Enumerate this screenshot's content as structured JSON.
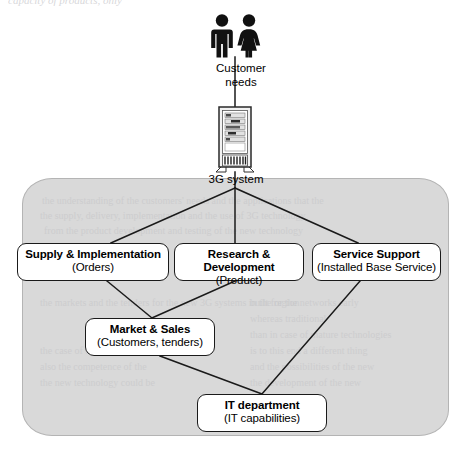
{
  "page": {
    "width": 469,
    "height": 454,
    "background": "#ffffff",
    "top_partial_caption": "capacity of products, only"
  },
  "diagram": {
    "type": "organizational-flow",
    "panel": {
      "name": "organisation-boundary",
      "fill": "#d9d9d9",
      "stroke": "#b4b4b4"
    },
    "actor": {
      "icon": "two-people-icon",
      "label_line1": "Customer",
      "label_line2": "needs",
      "color": "#000000"
    },
    "system": {
      "icon": "server-tower-icon",
      "label": "3G system",
      "color": "#000000"
    },
    "nodes": [
      {
        "id": "supply",
        "title": "Supply & Implementation",
        "subtitle": "(Orders)"
      },
      {
        "id": "rnd",
        "title": "Research & Development",
        "subtitle": "(Product)"
      },
      {
        "id": "service",
        "title": "Service Support",
        "subtitle": "(Installed Base Service)"
      },
      {
        "id": "market",
        "title": "Market & Sales",
        "subtitle": "(Customers, tenders)"
      },
      {
        "id": "it",
        "title": "IT department",
        "subtitle": "(IT capabilities)"
      }
    ],
    "connections": [
      {
        "from": "customer",
        "to": "system"
      },
      {
        "from": "system",
        "to": "supply"
      },
      {
        "from": "system",
        "to": "rnd"
      },
      {
        "from": "system",
        "to": "service"
      },
      {
        "from": "supply",
        "to": "market"
      },
      {
        "from": "rnd",
        "to": "market"
      },
      {
        "from": "market",
        "to": "it"
      },
      {
        "from": "service",
        "to": "it"
      }
    ]
  },
  "bleed_text": [
    "the understanding of the customers' needs and the applications that the",
    "the supply, delivery, implementation and the use of 3G technology",
    "from the product development and testing of the new technology",
    "the markets and the tenders for the new 3G systems in the region",
    "built for the networks early",
    "whereas traditional",
    "than in case of mature technologies",
    "is to this end a different thing",
    "and the possibilities of the new",
    "the case of the 3G systems the",
    "also the competence of the",
    "the new technology could be",
    "the development of the new"
  ]
}
